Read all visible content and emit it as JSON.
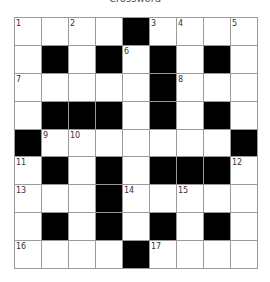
{
  "title": "Crossword",
  "grid": {
    "rows": 9,
    "cols": 9,
    "colors": {
      "black": "#000000",
      "white": "#ffffff",
      "border": "#9a9a9a"
    },
    "layout": [
      [
        "1",
        ".",
        "2",
        ".",
        "#",
        "3",
        "4",
        ".",
        "5"
      ],
      [
        ".",
        "#",
        ".",
        "#",
        "6",
        "#",
        ".",
        "#",
        "."
      ],
      [
        "7",
        ".",
        ".",
        ".",
        ".",
        "#",
        "8",
        ".",
        "."
      ],
      [
        ".",
        "#",
        "#",
        "#",
        ".",
        "#",
        ".",
        "#",
        "."
      ],
      [
        "#",
        "9",
        "10",
        ".",
        ".",
        ".",
        ".",
        ".",
        "#"
      ],
      [
        "11",
        "#",
        ".",
        "#",
        ".",
        "#",
        "#",
        "#",
        "12"
      ],
      [
        "13",
        ".",
        ".",
        "#",
        "14",
        ".",
        "15",
        ".",
        "."
      ],
      [
        ".",
        "#",
        ".",
        "#",
        ".",
        "#",
        ".",
        "#",
        "."
      ],
      [
        "16",
        ".",
        ".",
        ".",
        "#",
        "17",
        ".",
        ".",
        "."
      ]
    ]
  }
}
